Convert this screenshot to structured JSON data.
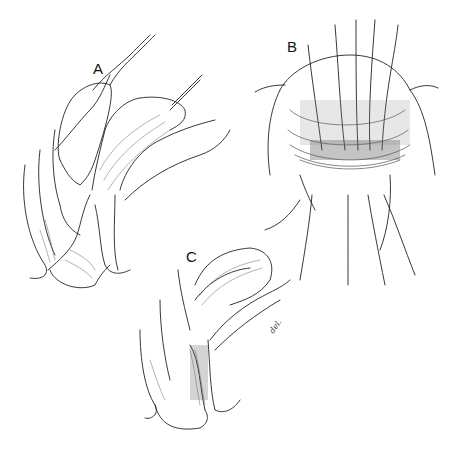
{
  "figure": {
    "panels": [
      {
        "label": "A",
        "description": "Sagittal anatomical view with sutures placed through tissue"
      },
      {
        "label": "B",
        "description": "Frontal view showing multiple sutures across the tissue opening"
      },
      {
        "label": "C",
        "description": "Sagittal anatomical view after repair"
      }
    ],
    "signature": "del."
  }
}
